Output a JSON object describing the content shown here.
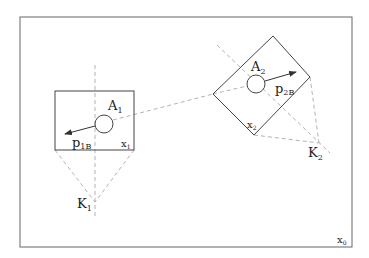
{
  "diagram": {
    "frame_label": {
      "base": "x",
      "sub": "0"
    },
    "body1": {
      "A": {
        "base": "A",
        "sub": "1"
      },
      "p": {
        "base": "p",
        "sub": "1B"
      },
      "x": {
        "base": "x",
        "sub": "1"
      },
      "K": {
        "base": "K",
        "sub": "1"
      }
    },
    "body2": {
      "A": {
        "base": "A",
        "sub": "2"
      },
      "p": {
        "base": "p",
        "sub": "2B"
      },
      "x": {
        "base": "x",
        "sub": "2"
      },
      "K": {
        "base": "K",
        "sub": "2"
      }
    },
    "colors": {
      "line": "#444444",
      "dashed": "#aaaaaa",
      "frame": "#666666"
    }
  }
}
